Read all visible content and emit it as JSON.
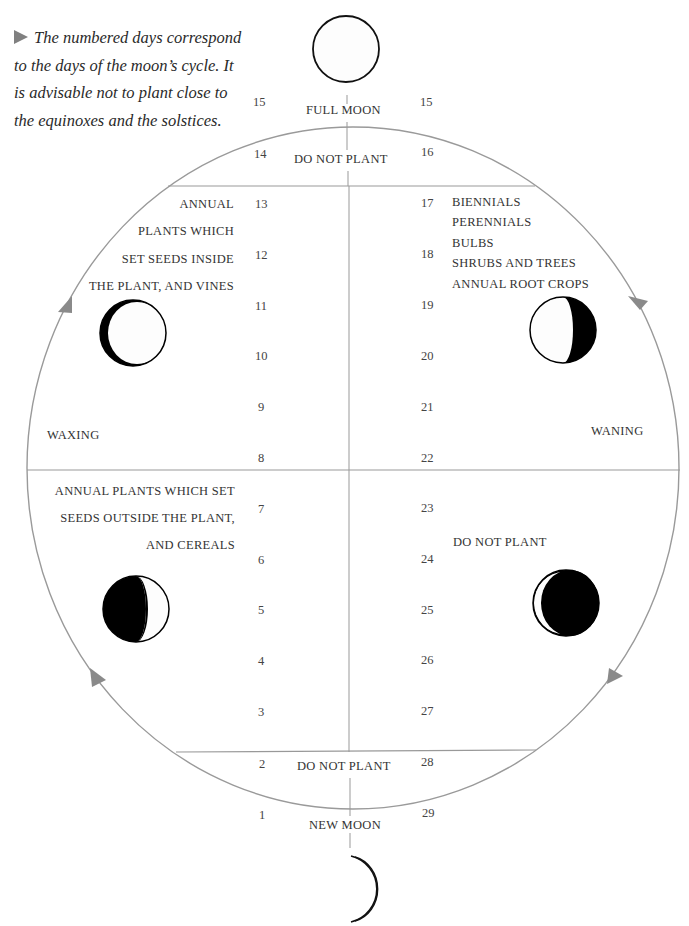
{
  "caption": {
    "text": "The numbered days correspond to the days of the moon’s cycle. It is advisable not to plant close to the equinoxes and the solstices."
  },
  "top": {
    "phase_label": "FULL MOON",
    "day_left": "15",
    "day_right": "15",
    "zone_label": "DO NOT PLANT",
    "zone_day_left": "14",
    "zone_day_right": "16"
  },
  "bottom": {
    "phase_label": "NEW MOON",
    "day_left": "1",
    "day_right": "29",
    "zone_label": "DO NOT PLANT",
    "zone_day_left": "2",
    "zone_day_right": "28"
  },
  "quadrants": {
    "upper_left": {
      "lines": [
        "ANNUAL",
        "PLANTS WHICH",
        "SET SEEDS INSIDE",
        "THE PLANT, AND VINES"
      ],
      "days": [
        "13",
        "12",
        "11",
        "10",
        "9",
        "8"
      ],
      "side_label": "WAXING"
    },
    "upper_right": {
      "lines": [
        "BIENNIALS",
        "PERENNIALS",
        "BULBS",
        "SHRUBS AND TREES",
        "ANNUAL ROOT CROPS"
      ],
      "days": [
        "17",
        "18",
        "19",
        "20",
        "21",
        "22"
      ],
      "side_label": "WANING"
    },
    "lower_left": {
      "lines": [
        "ANNUAL PLANTS WHICH SET",
        "SEEDS OUTSIDE THE PLANT,",
        "AND CEREALS"
      ],
      "days": [
        "7",
        "6",
        "5",
        "4",
        "3"
      ]
    },
    "lower_right": {
      "lines": [
        "DO NOT PLANT"
      ],
      "days": [
        "23",
        "24",
        "25",
        "26",
        "27"
      ]
    }
  },
  "moon_icons": [
    "full-moon",
    "waxing-crescent-light",
    "waning-gibbous-dark-right",
    "first-quarter-dark-left",
    "waning-crescent-dark",
    "new-moon-crescent"
  ],
  "colors": {
    "circle_line": "#9a9a9a",
    "arrow": "#8a8a8a",
    "text": "#333333",
    "moon_dark": "#000000"
  }
}
